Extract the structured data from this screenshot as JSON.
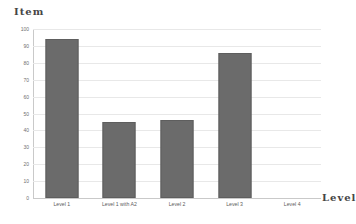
{
  "chart_data": {
    "type": "bar",
    "title": "",
    "xlabel": "Level",
    "ylabel": "Item",
    "categories": [
      "Level 1",
      "Level 1 with A2",
      "Level 2",
      "Level 3",
      "Level 4"
    ],
    "values": [
      94,
      45,
      46,
      86,
      0
    ],
    "ylim": [
      0,
      100
    ],
    "yticks": [
      0,
      10,
      20,
      30,
      40,
      50,
      60,
      70,
      80,
      90,
      100
    ],
    "ytick_labels": [
      "0",
      "10",
      "20",
      "30",
      "40",
      "50",
      "60",
      "70",
      "80",
      "90",
      "100"
    ],
    "grid": true,
    "grid_axis": "y",
    "legend": false,
    "series": [
      {
        "name": "Item",
        "values": [
          94,
          45,
          46,
          86,
          0
        ],
        "color": "#6b6b6b"
      }
    ]
  },
  "colors": {
    "bar_fill": "#6b6b6b",
    "bar_edge": "#5e5e5e",
    "gridline": "#e8e8e8",
    "axis_line": "#c9c9c9",
    "background": "#ffffff",
    "tick_text": "#6f6f6f",
    "axis_title_text": "#454545"
  }
}
